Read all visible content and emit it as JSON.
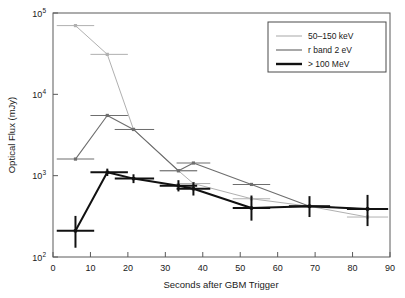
{
  "figure": {
    "background_color": "#ffffff",
    "frame_color": "#5a5a5a"
  },
  "axes": {
    "x_title": "Seconds after GBM Trigger",
    "y_title": "Optical Flux (mJy)",
    "x_ticks": [
      "0",
      "10",
      "20",
      "30",
      "40",
      "50",
      "60",
      "70",
      "80",
      "90"
    ],
    "y_ticks": [
      {
        "mantissa": "10",
        "exponent": "2"
      },
      {
        "mantissa": "10",
        "exponent": "3"
      },
      {
        "mantissa": "10",
        "exponent": "4"
      },
      {
        "mantissa": "10",
        "exponent": "5"
      }
    ]
  },
  "legend": {
    "entries": [
      {
        "label": "50–150 keV",
        "color": "#b0b0b0",
        "width": 1.1
      },
      {
        "label": "r band 2 eV",
        "color": "#6e6e6e",
        "width": 1.2
      },
      {
        "label": "> 100 MeV",
        "color": "#111111",
        "width": 2.4
      }
    ]
  },
  "chart_data": {
    "type": "line",
    "title": "",
    "xlabel": "Seconds after GBM Trigger",
    "ylabel": "Optical Flux (mJy)",
    "xlim": [
      0,
      90
    ],
    "ylim": [
      100,
      100000
    ],
    "yscale": "log",
    "xscale": "linear",
    "grid": false,
    "legend_position": "top-right",
    "series": [
      {
        "name": "50–150 keV",
        "color": "#b0b0b0",
        "points": [
          {
            "x": 6.0,
            "y": 70000,
            "xerr_low": 5.0,
            "xerr_high": 5.0
          },
          {
            "x": 14.5,
            "y": 31000,
            "xerr_low": 4.5,
            "xerr_high": 5.5
          },
          {
            "x": 21.5,
            "y": 3700,
            "xerr_low": 5.0,
            "xerr_high": 5.5
          },
          {
            "x": 33.5,
            "y": 1150,
            "xerr_low": 5.0,
            "xerr_high": 5.0
          },
          {
            "x": 37.5,
            "y": 800,
            "xerr_low": 4.5,
            "xerr_high": 4.5
          },
          {
            "x": 53.0,
            "y": 520,
            "xerr_low": 5.0,
            "xerr_high": 5.0
          },
          {
            "x": 68.5,
            "y": 420,
            "xerr_low": 5.5,
            "xerr_high": 5.5
          },
          {
            "x": 84.0,
            "y": 310,
            "xerr_low": 5.5,
            "xerr_high": 5.5
          }
        ]
      },
      {
        "name": "r band 2 eV",
        "color": "#6e6e6e",
        "points": [
          {
            "x": 6.0,
            "y": 1600,
            "xerr_low": 5.0,
            "xerr_high": 5.0
          },
          {
            "x": 14.5,
            "y": 5500,
            "xerr_low": 4.5,
            "xerr_high": 5.5
          },
          {
            "x": 21.5,
            "y": 3700,
            "xerr_low": 5.0,
            "xerr_high": 5.5
          },
          {
            "x": 33.5,
            "y": 1150,
            "xerr_low": 5.0,
            "xerr_high": 5.0
          },
          {
            "x": 37.5,
            "y": 1430,
            "xerr_low": 4.5,
            "xerr_high": 4.5
          },
          {
            "x": 53.0,
            "y": 780,
            "xerr_low": 5.0,
            "xerr_high": 5.0
          },
          {
            "x": 68.5,
            "y": 420,
            "xerr_low": 5.5,
            "xerr_high": 5.5
          },
          {
            "x": 84.0,
            "y": 390,
            "xerr_low": 5.5,
            "xerr_high": 5.5
          }
        ]
      },
      {
        "name": "> 100 MeV",
        "color": "#111111",
        "points": [
          {
            "x": 6.0,
            "y": 210,
            "xerr_low": 5.0,
            "xerr_high": 5.0,
            "yerr_low": 80,
            "yerr_high": 110
          },
          {
            "x": 14.5,
            "y": 1100,
            "xerr_low": 4.5,
            "xerr_high": 5.5,
            "yerr_low": 110,
            "yerr_high": 120
          },
          {
            "x": 21.5,
            "y": 920,
            "xerr_low": 5.0,
            "xerr_high": 5.5,
            "yerr_low": 110,
            "yerr_high": 120
          },
          {
            "x": 33.5,
            "y": 750,
            "xerr_low": 5.0,
            "xerr_high": 5.0,
            "yerr_low": 110,
            "yerr_high": 130
          },
          {
            "x": 37.5,
            "y": 690,
            "xerr_low": 4.5,
            "xerr_high": 4.5,
            "yerr_low": 120,
            "yerr_high": 140
          },
          {
            "x": 53.0,
            "y": 400,
            "xerr_low": 5.0,
            "xerr_high": 5.0,
            "yerr_low": 120,
            "yerr_high": 170
          },
          {
            "x": 68.5,
            "y": 420,
            "xerr_low": 5.5,
            "xerr_high": 5.5,
            "yerr_low": 110,
            "yerr_high": 140
          },
          {
            "x": 84.0,
            "y": 390,
            "xerr_low": 5.5,
            "xerr_high": 5.5,
            "yerr_low": 150,
            "yerr_high": 190
          }
        ]
      }
    ]
  }
}
